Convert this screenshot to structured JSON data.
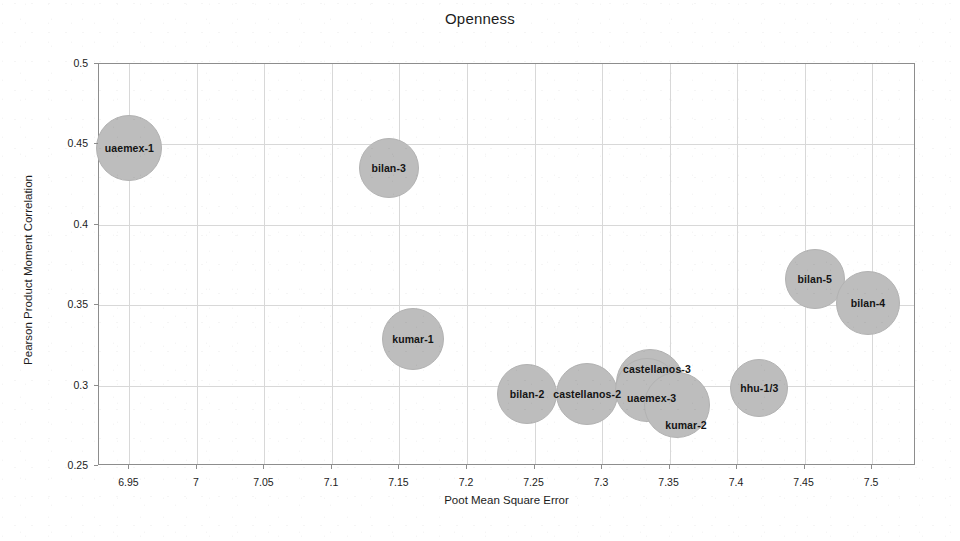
{
  "chart_data": {
    "type": "scatter",
    "title": "Openness",
    "xlabel": "Poot Mean Square Error",
    "ylabel": "Pearson Product Moment Correlation",
    "xlim": [
      6.9275,
      7.5325
    ],
    "ylim": [
      0.25,
      0.5
    ],
    "grid": true,
    "legend": "none",
    "xticks": [
      "6.95",
      "7",
      "7.05",
      "7.1",
      "7.15",
      "7.2",
      "7.25",
      "7.3",
      "7.35",
      "7.4",
      "7.45",
      "7.5"
    ],
    "xtick_values": [
      6.95,
      7.0,
      7.05,
      7.1,
      7.15,
      7.2,
      7.25,
      7.3,
      7.35,
      7.4,
      7.45,
      7.5
    ],
    "yticks": [
      "0.25",
      "0.3",
      "0.35",
      "0.4",
      "0.45",
      "0.5"
    ],
    "ytick_values": [
      0.25,
      0.3,
      0.35,
      0.4,
      0.45,
      0.5
    ],
    "marker_color": "#bdbdbd",
    "points": [
      {
        "label": "uaemex-1",
        "x": 6.95,
        "y": 0.448,
        "size": 66
      },
      {
        "label": "bilan-3",
        "x": 7.142,
        "y": 0.4355,
        "size": 60
      },
      {
        "label": "kumar-1",
        "x": 7.16,
        "y": 0.329,
        "size": 62
      },
      {
        "label": "bilan-2",
        "x": 7.2445,
        "y": 0.2945,
        "size": 60
      },
      {
        "label": "castellanos-2",
        "x": 7.289,
        "y": 0.2945,
        "size": 62
      },
      {
        "label": "castellanos-3",
        "x": 7.3355,
        "y": 0.3015,
        "size": 68
      },
      {
        "label": "uaemex-3",
        "x": 7.333,
        "y": 0.2975,
        "size": 64
      },
      {
        "label": "kumar-2",
        "x": 7.3555,
        "y": 0.288,
        "size": 66
      },
      {
        "label": "hhu-1/3",
        "x": 7.4165,
        "y": 0.2985,
        "size": 58
      },
      {
        "label": "bilan-5",
        "x": 7.4575,
        "y": 0.3665,
        "size": 60
      },
      {
        "label": "bilan-4",
        "x": 7.497,
        "y": 0.3515,
        "size": 64
      }
    ],
    "point_label_offsets": [
      {
        "label": "uaemex-1",
        "dx": 0,
        "dy": 0
      },
      {
        "label": "bilan-3",
        "dx": 0,
        "dy": 0
      },
      {
        "label": "kumar-1",
        "dx": 0,
        "dy": 0
      },
      {
        "label": "bilan-2",
        "dx": 0,
        "dy": 0
      },
      {
        "label": "castellanos-2",
        "dx": 0,
        "dy": 0
      },
      {
        "label": "castellanos-3",
        "dx": 7,
        "dy": -14
      },
      {
        "label": "uaemex-3",
        "dx": 5,
        "dy": 8
      },
      {
        "label": "kumar-2",
        "dx": 9,
        "dy": 20
      },
      {
        "label": "hhu-1/3",
        "dx": 0,
        "dy": 0
      },
      {
        "label": "bilan-5",
        "dx": 0,
        "dy": 0
      },
      {
        "label": "bilan-4",
        "dx": 0,
        "dy": 0
      }
    ]
  }
}
